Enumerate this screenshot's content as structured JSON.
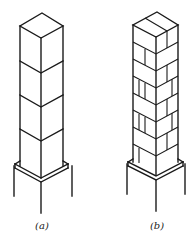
{
  "figure": {
    "panels": [
      {
        "id": "a",
        "label": "(a)",
        "description": "Column made of stacked solid blocks",
        "segments": 4
      },
      {
        "id": "b",
        "label": "(b)",
        "description": "Column built of staggered bricks",
        "courses": 11
      }
    ],
    "colors": {
      "line": "#1a1a1a",
      "background": "#ffffff"
    }
  }
}
